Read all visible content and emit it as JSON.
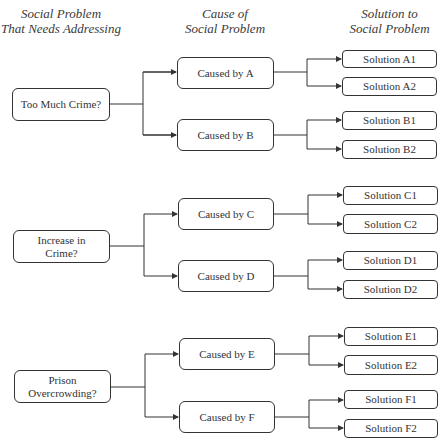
{
  "headers": {
    "col1": [
      "Social Problem",
      "That Needs Addressing"
    ],
    "col2": [
      "Cause of",
      "Social Problem"
    ],
    "col3": [
      "Solution to",
      "Social Problem"
    ]
  },
  "problems": [
    {
      "label": "Too Much Crime?",
      "causes": [
        {
          "label": "Caused by A",
          "solutions": [
            "Solution A1",
            "Solution A2"
          ]
        },
        {
          "label": "Caused by B",
          "solutions": [
            "Solution B1",
            "Solution B2"
          ]
        }
      ]
    },
    {
      "label": "Increase in Crime?",
      "causes": [
        {
          "label": "Caused by C",
          "solutions": [
            "Solution C1",
            "Solution C2"
          ]
        },
        {
          "label": "Caused by D",
          "solutions": [
            "Solution D1",
            "Solution D2"
          ]
        }
      ]
    },
    {
      "label": "Prison Overcrowding?",
      "causes": [
        {
          "label": "Caused by E",
          "solutions": [
            "Solution E1",
            "Solution E2"
          ]
        },
        {
          "label": "Caused by F",
          "solutions": [
            "Solution F1",
            "Solution F2"
          ]
        }
      ]
    }
  ],
  "colors": {
    "line": "#333333",
    "text": "#333333",
    "background": "#ffffff"
  }
}
